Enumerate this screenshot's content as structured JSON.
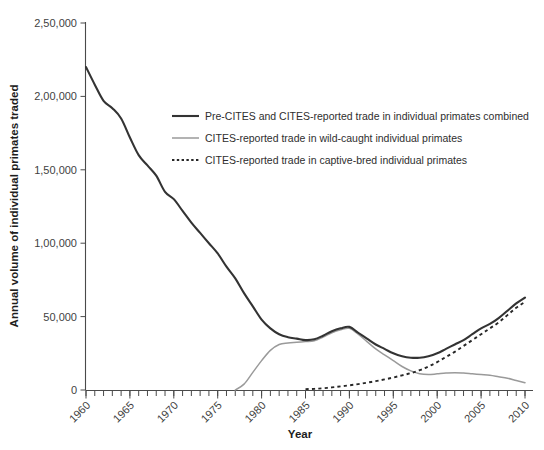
{
  "chart_data": {
    "type": "line",
    "title": "",
    "xlabel": "Year",
    "ylabel": "Annual volume of individual primates traded",
    "xlim": [
      1960,
      2010
    ],
    "ylim": [
      0,
      250000
    ],
    "grid": false,
    "legend_position": "upper-center-inside",
    "x_tick_labels": [
      "1960",
      "1965",
      "1970",
      "1975",
      "1980",
      "1985",
      "1990",
      "1995",
      "2000",
      "2005",
      "2010"
    ],
    "x_tick_values": [
      1960,
      1965,
      1970,
      1975,
      1980,
      1985,
      1990,
      1995,
      2000,
      2005,
      2010
    ],
    "x_minor_tick_interval": 1,
    "y_tick_labels": [
      "0",
      "50,000",
      "1,00,000",
      "1,50,000",
      "2,00,000",
      "2,50,000"
    ],
    "y_tick_values": [
      0,
      50000,
      100000,
      150000,
      200000,
      250000
    ],
    "x": [
      1960,
      1961,
      1962,
      1963,
      1964,
      1965,
      1966,
      1967,
      1968,
      1969,
      1970,
      1971,
      1972,
      1973,
      1974,
      1975,
      1976,
      1977,
      1978,
      1979,
      1980,
      1981,
      1982,
      1983,
      1984,
      1985,
      1986,
      1987,
      1988,
      1989,
      1990,
      1991,
      1992,
      1993,
      1994,
      1995,
      1996,
      1997,
      1998,
      1999,
      2000,
      2001,
      2002,
      2003,
      2004,
      2005,
      2006,
      2007,
      2008,
      2009,
      2010
    ],
    "series": [
      {
        "name": "Pre-CITES and CITES-reported trade in individual primates combined",
        "style": "solid",
        "color": "#333333",
        "width": 2.1,
        "values": [
          220000,
          208000,
          197000,
          192000,
          185000,
          172000,
          160000,
          153000,
          146000,
          135000,
          130000,
          122000,
          114000,
          107000,
          100000,
          93000,
          84000,
          76000,
          66000,
          57000,
          48000,
          42000,
          38000,
          36000,
          35000,
          34000,
          34500,
          37000,
          40000,
          42000,
          43000,
          39000,
          35000,
          31000,
          28000,
          25000,
          23000,
          22000,
          22000,
          23000,
          25000,
          28000,
          31000,
          34000,
          38000,
          42000,
          45000,
          49000,
          54000,
          59000,
          63000
        ]
      },
      {
        "name": "CITES-reported trade in wild-caught individual primates",
        "style": "solid",
        "color": "#9a9a9a",
        "width": 1.5,
        "values": [
          null,
          null,
          null,
          null,
          null,
          null,
          null,
          null,
          null,
          null,
          null,
          null,
          null,
          null,
          null,
          null,
          null,
          0,
          4000,
          12000,
          20000,
          27000,
          31000,
          32000,
          32500,
          33000,
          33500,
          36000,
          39000,
          41000,
          42000,
          38000,
          33000,
          28000,
          24000,
          20000,
          16000,
          13000,
          11000,
          10500,
          11000,
          11500,
          11800,
          11500,
          11000,
          10500,
          10000,
          9000,
          8000,
          6500,
          5000
        ]
      },
      {
        "name": "CITES-reported trade in captive-bred individual primates",
        "style": "dotted",
        "color": "#272727",
        "width": 1.9,
        "values": [
          null,
          null,
          null,
          null,
          null,
          null,
          null,
          null,
          null,
          null,
          null,
          null,
          null,
          null,
          null,
          null,
          null,
          null,
          null,
          null,
          null,
          null,
          null,
          null,
          null,
          600,
          800,
          1200,
          1800,
          2500,
          3200,
          4000,
          5000,
          6000,
          7200,
          8500,
          10000,
          11500,
          13500,
          16000,
          19000,
          22500,
          26000,
          30000,
          34000,
          38000,
          42000,
          46000,
          51000,
          56000,
          60000
        ]
      }
    ]
  },
  "legend": {
    "items": [
      {
        "label": "Pre-CITES and CITES-reported trade in individual primates combined",
        "swatch": "solid-thick-black"
      },
      {
        "label": "CITES-reported trade in wild-caught individual primates",
        "swatch": "solid-thin-gray"
      },
      {
        "label": "CITES-reported trade in captive-bred individual primates",
        "swatch": "dotted-black"
      }
    ]
  }
}
